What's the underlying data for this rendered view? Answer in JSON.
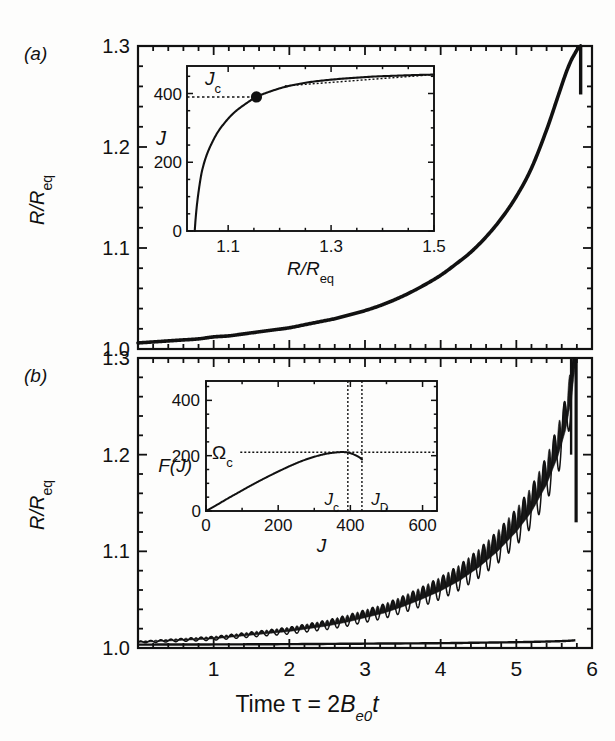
{
  "figure": {
    "kind": "two-panel scientific line plot with insets",
    "background": "#fdfdfc",
    "ink": "#111111"
  },
  "panels": [
    {
      "id": "a",
      "label": "(a)",
      "ylabel": "R/R_eq",
      "ylabel_parts": {
        "num": "R",
        "slash": "/",
        "den": "R",
        "sub": "eq"
      },
      "yticks": [
        "1.0",
        "1.1",
        "1.2",
        "1.3"
      ],
      "xticks": [
        "",
        "",
        "",
        "",
        "",
        ""
      ]
    },
    {
      "id": "b",
      "label": "(b)",
      "ylabel": "R/R_eq",
      "ylabel_parts": {
        "num": "R",
        "slash": "/",
        "den": "R",
        "sub": "eq"
      },
      "yticks": [
        "1.0",
        "1.1",
        "1.2",
        "1.3"
      ],
      "xticks": [
        "1",
        "2",
        "3",
        "4",
        "5",
        "6"
      ]
    }
  ],
  "xaxis": {
    "label_text": "Time τ = 2B_e0 t",
    "label_parts": {
      "time": "Time",
      "tau": "τ",
      "eq": "=",
      "two": "2",
      "B": "B",
      "sub": "e0",
      "t": "t"
    },
    "ticklabels": [
      "1",
      "2",
      "3",
      "4",
      "5",
      "6"
    ]
  },
  "chart_data": [
    {
      "id": "panel-a-main",
      "type": "line",
      "title": "(a)",
      "xlabel": "Time τ = 2B_e0 t",
      "ylabel": "R/R_eq",
      "xlim": [
        0,
        6
      ],
      "ylim": [
        1.0,
        1.3
      ],
      "xticks": [
        1,
        2,
        3,
        4,
        5,
        6
      ],
      "yticks": [
        1.0,
        1.1,
        1.2,
        1.3
      ],
      "minor_xticks_per_major": 5,
      "minor_yticks_per_major": 5,
      "grid": false,
      "legend": "none",
      "series": [
        {
          "name": "R/R_eq (non-oscillatory growth, diverges near τ≈5.85)",
          "x": [
            0.0,
            0.2,
            0.4,
            0.6,
            0.8,
            1.0,
            1.2,
            1.4,
            1.6,
            1.8,
            2.0,
            2.2,
            2.4,
            2.6,
            2.8,
            3.0,
            3.2,
            3.4,
            3.6,
            3.8,
            4.0,
            4.2,
            4.4,
            4.6,
            4.8,
            5.0,
            5.2,
            5.4,
            5.55,
            5.65,
            5.72,
            5.77,
            5.8,
            5.82,
            5.84,
            5.85
          ],
          "y": [
            1.006,
            1.007,
            1.008,
            1.009,
            1.01,
            1.012,
            1.013,
            1.015,
            1.017,
            1.019,
            1.021,
            1.024,
            1.027,
            1.03,
            1.034,
            1.038,
            1.043,
            1.049,
            1.056,
            1.064,
            1.073,
            1.084,
            1.096,
            1.111,
            1.129,
            1.151,
            1.179,
            1.217,
            1.25,
            1.272,
            1.285,
            1.292,
            1.296,
            1.298,
            1.299,
            1.3
          ]
        }
      ]
    },
    {
      "id": "panel-a-inset",
      "type": "line",
      "title": "",
      "xlabel": "R/R_eq",
      "ylabel": "J",
      "xlim": [
        1.02,
        1.5
      ],
      "ylim": [
        0,
        480
      ],
      "xticks": [
        1.1,
        1.3,
        1.5
      ],
      "yticks": [
        0,
        200,
        400
      ],
      "xticklabels": [
        "1.1",
        "1.3",
        "1.5"
      ],
      "yticklabels": [
        "0",
        "200",
        "400"
      ],
      "grid": false,
      "annotations": [
        {
          "text": "J_c",
          "kind": "axis-level-label",
          "value": 390
        }
      ],
      "dashed_lines": [
        {
          "orientation": "horizontal",
          "y": 390,
          "label": "J_c",
          "x_from": 1.02,
          "x_to": 1.155
        }
      ],
      "markers": [
        {
          "x": 1.155,
          "y": 390,
          "style": "filled-circle",
          "label": "J_c point"
        }
      ],
      "series": [
        {
          "name": "J vs R/R_eq",
          "x": [
            1.035,
            1.037,
            1.04,
            1.045,
            1.05,
            1.058,
            1.068,
            1.08,
            1.095,
            1.112,
            1.132,
            1.155,
            1.18,
            1.21,
            1.245,
            1.285,
            1.33,
            1.38,
            1.43,
            1.47,
            1.5
          ],
          "y": [
            0,
            40,
            85,
            140,
            180,
            220,
            255,
            288,
            318,
            345,
            368,
            390,
            405,
            419,
            430,
            438,
            444,
            449,
            452,
            454,
            455
          ]
        }
      ]
    },
    {
      "id": "panel-b-main",
      "type": "line",
      "title": "(b)",
      "xlabel": "Time τ = 2B_e0 t",
      "ylabel": "R/R_eq",
      "xlim": [
        0,
        6
      ],
      "ylim": [
        1.0,
        1.3
      ],
      "xticks": [
        1,
        2,
        3,
        4,
        5,
        6
      ],
      "yticks": [
        1.0,
        1.1,
        1.2,
        1.3
      ],
      "minor_xticks_per_major": 5,
      "minor_yticks_per_major": 5,
      "grid": false,
      "legend": "none",
      "series": [
        {
          "name": "R/R_eq with surface oscillations (growing amplitude, diverges near τ≈5.8)",
          "comment": "mean path with superposed oscillation of growing amplitude",
          "x": [
            0.0,
            0.25,
            0.5,
            0.75,
            1.0,
            1.25,
            1.5,
            1.75,
            2.0,
            2.25,
            2.5,
            2.75,
            3.0,
            3.25,
            3.5,
            3.75,
            4.0,
            4.25,
            4.5,
            4.75,
            5.0,
            5.2,
            5.4,
            5.55,
            5.65,
            5.72,
            5.78
          ],
          "y_mean": [
            1.006,
            1.007,
            1.008,
            1.009,
            1.01,
            1.012,
            1.014,
            1.016,
            1.018,
            1.021,
            1.024,
            1.028,
            1.033,
            1.038,
            1.045,
            1.053,
            1.062,
            1.073,
            1.087,
            1.104,
            1.125,
            1.146,
            1.175,
            1.205,
            1.232,
            1.262,
            1.3
          ],
          "osc_amp": [
            0.001,
            0.0012,
            0.0015,
            0.0018,
            0.002,
            0.0023,
            0.0027,
            0.0031,
            0.0036,
            0.0042,
            0.0049,
            0.0057,
            0.0066,
            0.0076,
            0.0088,
            0.0101,
            0.0116,
            0.0132,
            0.015,
            0.017,
            0.0192,
            0.0212,
            0.0235,
            0.0255,
            0.027,
            0.028,
            0.029
          ],
          "osc_frequency_cycles_per_unit_tau": 7.5
        },
        {
          "name": "lower envelope / non-oscillating reference trace",
          "x": [
            0.0,
            1.0,
            2.0,
            3.0,
            4.0,
            4.5,
            5.0,
            5.3,
            5.55,
            5.7,
            5.78
          ],
          "y": [
            1.0035,
            1.0037,
            1.004,
            1.0045,
            1.005,
            1.0055,
            1.006,
            1.0065,
            1.007,
            1.0075,
            1.008
          ]
        }
      ]
    },
    {
      "id": "panel-b-inset",
      "type": "line",
      "title": "",
      "xlabel": "J",
      "ylabel": "F(J)",
      "xlim": [
        0,
        640
      ],
      "ylim": [
        0,
        470
      ],
      "xticks": [
        0,
        200,
        400,
        600
      ],
      "yticks": [
        0,
        200,
        400
      ],
      "xticklabels": [
        "0",
        "200",
        "400",
        "600"
      ],
      "yticklabels": [
        "0",
        "200",
        "400"
      ],
      "grid": false,
      "annotations": [
        {
          "text": "Ω_c",
          "kind": "axis-level-label",
          "value": 212
        },
        {
          "text": "J_c",
          "kind": "vline-label",
          "value": 393
        },
        {
          "text": "J_D",
          "kind": "vline-label",
          "value": 432
        }
      ],
      "dashed_lines": [
        {
          "orientation": "horizontal",
          "y": 212,
          "label": "Ω_c",
          "x_from": 95,
          "x_to": 640
        },
        {
          "orientation": "vertical",
          "x": 393,
          "label": "J_c"
        },
        {
          "orientation": "vertical",
          "x": 432,
          "label": "J_D"
        }
      ],
      "series": [
        {
          "name": "F(J)",
          "x": [
            0,
            30,
            60,
            90,
            120,
            150,
            180,
            210,
            240,
            270,
            300,
            330,
            355,
            375,
            390,
            400,
            412,
            425,
            432
          ],
          "y": [
            0,
            22,
            45,
            67,
            89,
            110,
            130,
            149,
            167,
            183,
            196,
            206,
            211,
            213,
            212,
            209,
            203,
            194,
            186
          ]
        }
      ]
    }
  ],
  "labels": {
    "panel_a": "(a)",
    "panel_b": "(b)",
    "inset_a_ylabel": "J",
    "inset_a_xlabel": "R/R_eq",
    "inset_a_annotation": "J_c",
    "inset_b_ylabel": "F(J)",
    "inset_b_xlabel": "J",
    "inset_b_annotation_omega": "Ω_c",
    "inset_b_annotation_jc": "J_c",
    "inset_b_annotation_jd": "J_D"
  }
}
